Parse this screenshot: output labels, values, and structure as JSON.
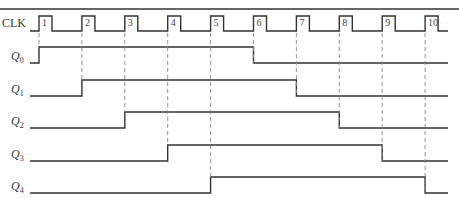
{
  "diagram": {
    "type": "timing-diagram",
    "clock": {
      "label": "CLK",
      "pulse_numbers": [
        "1",
        "2",
        "3",
        "4",
        "5",
        "6",
        "7",
        "8",
        "9",
        "10"
      ]
    },
    "signals": [
      {
        "name": "Q",
        "sub": "0",
        "rises_at_pulse": 1,
        "falls_at_pulse": 6
      },
      {
        "name": "Q",
        "sub": "1",
        "rises_at_pulse": 2,
        "falls_at_pulse": 7
      },
      {
        "name": "Q",
        "sub": "2",
        "rises_at_pulse": 3,
        "falls_at_pulse": 8
      },
      {
        "name": "Q",
        "sub": "3",
        "rises_at_pulse": 4,
        "falls_at_pulse": 9
      },
      {
        "name": "Q",
        "sub": "4",
        "rises_at_pulse": 5,
        "falls_at_pulse": 10
      }
    ],
    "colors": {
      "line": "#333333",
      "dash": "#888888"
    }
  }
}
